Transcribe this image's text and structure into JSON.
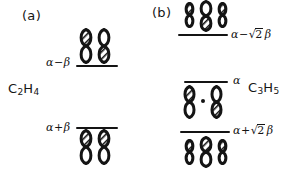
{
  "figure": {
    "type": "molecular-orbital-energy-diagram",
    "theory": "Huckel",
    "panels": [
      {
        "id": "a",
        "caption": "(a)",
        "molecule_formula_text": "C2H4",
        "molecule_label_parts": [
          "C",
          "2",
          "H",
          "4"
        ],
        "levels": [
          {
            "name": "antibonding",
            "energy_label_text": "α − β",
            "energy_tokens": {
              "alpha": "α",
              "operator": "−",
              "beta": "β"
            },
            "label_position": "left",
            "orbitals_position": "above",
            "orbital_count": 2,
            "orbitals": [
              {
                "top_lobe": "filled",
                "bottom_lobe": "open",
                "size": "normal"
              },
              {
                "top_lobe": "open",
                "bottom_lobe": "filled",
                "size": "normal"
              }
            ]
          },
          {
            "name": "bonding",
            "energy_label_text": "α + β",
            "energy_tokens": {
              "alpha": "α",
              "operator": "+",
              "beta": "β"
            },
            "label_position": "left",
            "orbitals_position": "below",
            "orbital_count": 2,
            "orbitals": [
              {
                "top_lobe": "filled",
                "bottom_lobe": "open",
                "size": "normal"
              },
              {
                "top_lobe": "filled",
                "bottom_lobe": "open",
                "size": "normal"
              }
            ]
          }
        ]
      },
      {
        "id": "b",
        "caption": "(b)",
        "molecule_formula_text": "C3H5",
        "molecule_label_parts": [
          "C",
          "3",
          "H",
          "5"
        ],
        "levels": [
          {
            "name": "antibonding",
            "energy_label_text": "α − √2 β",
            "energy_tokens": {
              "alpha": "α",
              "operator": "−",
              "radical": "√",
              "coefficient": "2",
              "beta": "β"
            },
            "label_position": "right",
            "orbitals_position": "above",
            "orbital_count": 3,
            "orbitals": [
              {
                "top_lobe": "filled",
                "bottom_lobe": "open",
                "size": "small"
              },
              {
                "top_lobe": "open",
                "bottom_lobe": "filled",
                "size": "large"
              },
              {
                "top_lobe": "filled",
                "bottom_lobe": "open",
                "size": "small"
              }
            ]
          },
          {
            "name": "nonbonding",
            "energy_label_text": "α",
            "energy_tokens": {
              "alpha": "α"
            },
            "label_position": "right",
            "orbitals_position": "below",
            "orbital_count": 2,
            "has_node_dot": true,
            "orbitals": [
              {
                "top_lobe": "filled",
                "bottom_lobe": "open",
                "size": "normal"
              },
              {
                "top_lobe": "open",
                "bottom_lobe": "filled",
                "size": "normal"
              }
            ]
          },
          {
            "name": "bonding",
            "energy_label_text": "α + √2 β",
            "energy_tokens": {
              "alpha": "α",
              "operator": "+",
              "radical": "√",
              "coefficient": "2",
              "beta": "β"
            },
            "label_position": "right",
            "orbitals_position": "below",
            "orbital_count": 3,
            "orbitals": [
              {
                "top_lobe": "filled",
                "bottom_lobe": "open",
                "size": "small"
              },
              {
                "top_lobe": "filled",
                "bottom_lobe": "open",
                "size": "large"
              },
              {
                "top_lobe": "filled",
                "bottom_lobe": "open",
                "size": "small"
              }
            ]
          }
        ]
      }
    ],
    "colors": {
      "ink": "#141414",
      "background": "#ffffff",
      "lobe_fill_open": "#ffffff",
      "lobe_fill_shaded": "#4a4a4a"
    }
  }
}
